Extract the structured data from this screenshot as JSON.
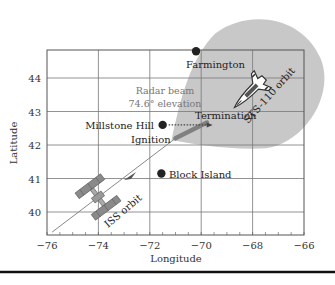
{
  "chart_data": {
    "type": "scatter",
    "title": "",
    "xlabel": "Longitude",
    "ylabel": "Latitude",
    "xlim": [
      -76,
      -66
    ],
    "ylim": [
      39.3,
      44.8
    ],
    "xticks": [
      -76,
      -74,
      -72,
      -70,
      -68,
      -66
    ],
    "xtick_labels": [
      "−76",
      "−74",
      "−72",
      "−70",
      "−68",
      "−66"
    ],
    "yticks": [
      40,
      41,
      42,
      43,
      44
    ],
    "ytick_labels": [
      "40",
      "41",
      "42",
      "43",
      "44"
    ],
    "grid": true,
    "sites": [
      {
        "name": "Farmington",
        "lon": -70.2,
        "lat": 44.8
      },
      {
        "name": "Millstone Hill",
        "lon": -71.5,
        "lat": 42.6
      },
      {
        "name": "Block Island",
        "lon": -71.55,
        "lat": 41.15
      }
    ],
    "events": {
      "ignition": {
        "label": "Ignition",
        "lon": -71.0,
        "lat": 42.2
      },
      "termination": {
        "label": "Termination",
        "lon": -69.7,
        "lat": 42.7
      }
    },
    "iss_orbit": {
      "label": "ISS orbit",
      "path": [
        [
          -75.8,
          39.4
        ],
        [
          -71.0,
          42.2
        ]
      ]
    },
    "sts_orbit": {
      "label": "STS-110 orbit"
    },
    "radar_beam": {
      "label_line1": "Radar beam",
      "label_line2": "74.6° elevation"
    }
  },
  "colors": {
    "grid": "#777777",
    "plume": "#c8c8c8",
    "site_dot": "#222222",
    "orbit_line": "#888888",
    "bar": "#808080"
  }
}
